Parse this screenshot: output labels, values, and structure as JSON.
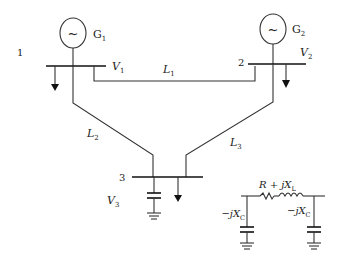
{
  "diagram": {
    "type": "three-bus power system one-line diagram",
    "buses": [
      {
        "id": "bus-1",
        "number": "1",
        "voltage_label": "V",
        "voltage_sub": "1",
        "generator": {
          "label": "G",
          "sub": "1",
          "symbol": "~"
        },
        "has_load": true
      },
      {
        "id": "bus-2",
        "number": "2",
        "voltage_label": "V",
        "voltage_sub": "2",
        "generator": {
          "label": "G",
          "sub": "2",
          "symbol": "~"
        },
        "has_load": true
      },
      {
        "id": "bus-3",
        "number": "3",
        "voltage_label": "V",
        "voltage_sub": "3",
        "has_load": true,
        "has_shunt_capacitor": true
      }
    ],
    "lines": [
      {
        "id": "line-1",
        "label": "L",
        "sub": "1",
        "from": "1",
        "to": "2"
      },
      {
        "id": "line-2",
        "label": "L",
        "sub": "2",
        "from": "1",
        "to": "3"
      },
      {
        "id": "line-3",
        "label": "L",
        "sub": "3",
        "from": "2",
        "to": "3"
      }
    ],
    "pi_model": {
      "series_label": "R + jX",
      "series_sub": "L",
      "shunt_left_label": "−jX",
      "shunt_left_sub": "C",
      "shunt_right_label": "−jX",
      "shunt_right_sub": "C"
    }
  }
}
